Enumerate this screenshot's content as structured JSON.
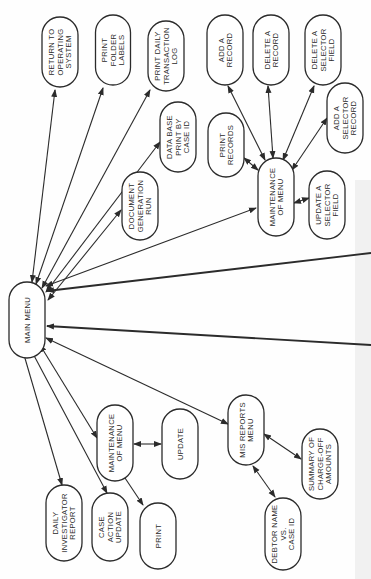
{
  "diagram": {
    "orientation": "rotated 90 degrees counter-clockwise",
    "colors": {
      "line": "#2b2b2b",
      "node_fill": "#ffffff",
      "background": "#fefefe"
    },
    "nodes": [
      {
        "id": "main_menu",
        "lines": [
          "MAIN MENU"
        ],
        "cx": 27,
        "cy": 320,
        "w": 36,
        "h": 76
      },
      {
        "id": "return_os",
        "lines": [
          "RETURN TO",
          "OPERATING",
          "SYSTEM"
        ],
        "cx": 60,
        "cy": 52,
        "w": 36,
        "h": 70
      },
      {
        "id": "print_folder_labels",
        "lines": [
          "PRINT",
          "FOLDER",
          "LABELS"
        ],
        "cx": 113,
        "cy": 50,
        "w": 35,
        "h": 70
      },
      {
        "id": "print_daily_log",
        "lines": [
          "PRINT DAILY",
          "TRANSACTION",
          "LOG"
        ],
        "cx": 166,
        "cy": 56,
        "w": 36,
        "h": 70
      },
      {
        "id": "add_record",
        "lines": [
          "ADD A",
          "RECORD"
        ],
        "cx": 225,
        "cy": 50,
        "w": 36,
        "h": 70
      },
      {
        "id": "delete_record",
        "lines": [
          "DELETE A",
          "RECORD"
        ],
        "cx": 271,
        "cy": 50,
        "w": 36,
        "h": 70
      },
      {
        "id": "delete_selector_field",
        "lines": [
          "DELETE A",
          "SELECTOR",
          "FIELD"
        ],
        "cx": 323,
        "cy": 50,
        "w": 36,
        "h": 70
      },
      {
        "id": "add_selector_record",
        "lines": [
          "ADD A",
          "SELECTOR",
          "RECORD"
        ],
        "cx": 345,
        "cy": 118,
        "w": 36,
        "h": 70
      },
      {
        "id": "db_print_case_id",
        "lines": [
          "DATA BASE",
          "PRINT BY",
          "CASE ID"
        ],
        "cx": 178,
        "cy": 137,
        "w": 36,
        "h": 70
      },
      {
        "id": "print_records",
        "lines": [
          "PRINT",
          "RECORDS"
        ],
        "cx": 226,
        "cy": 145,
        "w": 36,
        "h": 64
      },
      {
        "id": "doc_generation_run",
        "lines": [
          "DOCUMENT",
          "GENERATION",
          "RUN"
        ],
        "cx": 140,
        "cy": 206,
        "w": 36,
        "h": 68
      },
      {
        "id": "maint_menu_right",
        "lines": [
          "MAINTENANCE",
          "OF MENU"
        ],
        "cx": 276,
        "cy": 197,
        "w": 36,
        "h": 78
      },
      {
        "id": "update_selector_field",
        "lines": [
          "UPDATE A",
          "SELECTOR",
          "FIELD"
        ],
        "cx": 327,
        "cy": 205,
        "w": 36,
        "h": 68
      },
      {
        "id": "daily_investigator_report",
        "lines": [
          "DAILY",
          "INVESTIGATOR",
          "REPORT"
        ],
        "cx": 64,
        "cy": 523,
        "w": 36,
        "h": 76
      },
      {
        "id": "case_action_update",
        "lines": [
          "CASE",
          "ACTION",
          "UPDATE"
        ],
        "cx": 110,
        "cy": 527,
        "w": 36,
        "h": 68
      },
      {
        "id": "print_left",
        "lines": [
          "PRINT"
        ],
        "cx": 158,
        "cy": 536,
        "w": 36,
        "h": 66
      },
      {
        "id": "maint_menu_left",
        "lines": [
          "MAINTENANCE",
          "OF MENU"
        ],
        "cx": 115,
        "cy": 443,
        "w": 36,
        "h": 76
      },
      {
        "id": "update",
        "lines": [
          "UPDATE"
        ],
        "cx": 180,
        "cy": 444,
        "w": 36,
        "h": 70
      },
      {
        "id": "mis_reports_menu",
        "lines": [
          "MIS REPORTS",
          "MENU"
        ],
        "cx": 246,
        "cy": 430,
        "w": 36,
        "h": 70
      },
      {
        "id": "summary_chargeoff",
        "lines": [
          "SUMMARY OF",
          "CHARGE-OFF",
          "AMOUNTS"
        ],
        "cx": 320,
        "cy": 464,
        "w": 36,
        "h": 70
      },
      {
        "id": "debtor_name_case_id",
        "lines": [
          "DEBTOR NAME",
          "VS.",
          "CASE ID"
        ],
        "cx": 283,
        "cy": 534,
        "w": 36,
        "h": 72
      }
    ],
    "edges": [
      {
        "from": "main_menu",
        "to": "return_os",
        "x1": 32,
        "y1": 282,
        "x2": 55,
        "y2": 90,
        "arrow_end": true,
        "arrow_start": true
      },
      {
        "from": "main_menu",
        "to": "print_folder_labels",
        "x1": 36,
        "y1": 284,
        "x2": 103,
        "y2": 88,
        "arrow_end": true,
        "arrow_start": true
      },
      {
        "from": "main_menu",
        "to": "print_daily_log",
        "x1": 42,
        "y1": 288,
        "x2": 150,
        "y2": 90,
        "arrow_end": true,
        "arrow_start": true
      },
      {
        "from": "main_menu",
        "to": "db_print_case_id",
        "x1": 46,
        "y1": 292,
        "x2": 160,
        "y2": 142,
        "arrow_end": true,
        "arrow_start": true
      },
      {
        "from": "main_menu",
        "to": "doc_generation_run",
        "x1": 48,
        "y1": 300,
        "x2": 121,
        "y2": 210,
        "arrow_end": true,
        "arrow_start": true
      },
      {
        "from": "main_menu",
        "to": "maint_menu_right",
        "x1": 46,
        "y1": 286,
        "x2": 256,
        "y2": 208,
        "arrow_end": true,
        "arrow_start": true
      },
      {
        "from": "main_menu",
        "to": "offpage_upper",
        "x1": 47,
        "y1": 291,
        "x2": 371,
        "y2": 253,
        "arrow_start": true,
        "heavy": true
      },
      {
        "from": "main_menu",
        "to": "offpage_lower",
        "x1": 47,
        "y1": 326,
        "x2": 371,
        "y2": 345,
        "arrow_start": true,
        "heavy": true
      },
      {
        "from": "main_menu",
        "to": "mis_reports_menu",
        "x1": 46,
        "y1": 338,
        "x2": 228,
        "y2": 424,
        "arrow_end": true,
        "arrow_start": true
      },
      {
        "from": "main_menu",
        "to": "maint_menu_left",
        "x1": 40,
        "y1": 345,
        "x2": 97,
        "y2": 438,
        "arrow_end": true,
        "arrow_start": true
      },
      {
        "from": "main_menu",
        "to": "case_action_update",
        "x1": 30,
        "y1": 348,
        "x2": 107,
        "y2": 493,
        "arrow_end": true,
        "arrow_start": true
      },
      {
        "from": "main_menu",
        "to": "daily_investigator_report",
        "x1": 22,
        "y1": 348,
        "x2": 62,
        "y2": 485,
        "arrow_end": true,
        "arrow_start": true
      },
      {
        "from": "maint_menu_left",
        "to": "print_left",
        "x1": 125,
        "y1": 478,
        "x2": 143,
        "y2": 505,
        "arrow_end": true
      },
      {
        "from": "maint_menu_left",
        "to": "update",
        "x1": 134,
        "y1": 444,
        "x2": 161,
        "y2": 444,
        "arrow_end": true,
        "arrow_start": true
      },
      {
        "from": "mis_reports_menu",
        "to": "summary_chargeoff",
        "x1": 264,
        "y1": 434,
        "x2": 301,
        "y2": 459,
        "arrow_end": true,
        "arrow_start": true
      },
      {
        "from": "mis_reports_menu",
        "to": "debtor_name_case_id",
        "x1": 253,
        "y1": 466,
        "x2": 275,
        "y2": 497,
        "arrow_end": true,
        "arrow_start": true
      },
      {
        "from": "maint_menu_right",
        "to": "print_records",
        "x1": 258,
        "y1": 170,
        "x2": 244,
        "y2": 158,
        "arrow_end": true,
        "arrow_start": true
      },
      {
        "from": "maint_menu_right",
        "to": "add_record",
        "x1": 265,
        "y1": 160,
        "x2": 228,
        "y2": 86,
        "arrow_end": true,
        "arrow_start": true
      },
      {
        "from": "maint_menu_right",
        "to": "delete_record",
        "x1": 273,
        "y1": 158,
        "x2": 268,
        "y2": 86,
        "arrow_end": true,
        "arrow_start": true
      },
      {
        "from": "maint_menu_right",
        "to": "delete_selector_field",
        "x1": 283,
        "y1": 160,
        "x2": 314,
        "y2": 86,
        "arrow_end": true,
        "arrow_start": true
      },
      {
        "from": "maint_menu_right",
        "to": "add_selector_record",
        "x1": 292,
        "y1": 170,
        "x2": 327,
        "y2": 118,
        "arrow_end": true,
        "arrow_start": true
      },
      {
        "from": "maint_menu_right",
        "to": "update_selector_field",
        "x1": 294,
        "y1": 203,
        "x2": 309,
        "y2": 198,
        "arrow_end": true,
        "arrow_start": true
      }
    ]
  }
}
